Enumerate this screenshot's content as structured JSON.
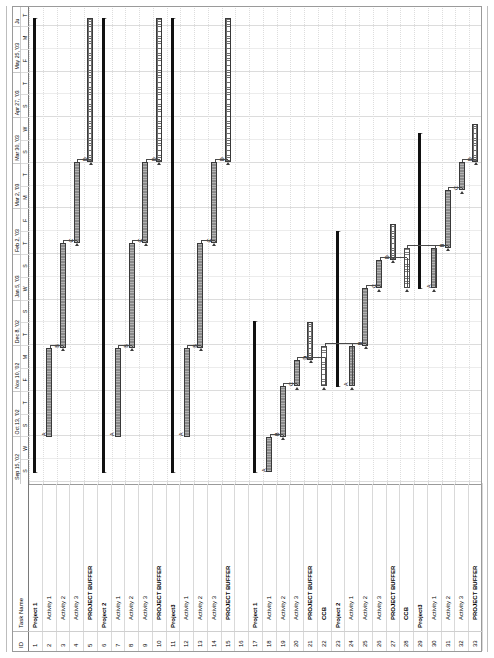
{
  "app": {
    "view_name": "Gantt Chart"
  },
  "table": {
    "headers": {
      "id": "ID",
      "name": "Task Name"
    },
    "rows": [
      {
        "id": "1",
        "name": "Project 1",
        "level": 0
      },
      {
        "id": "2",
        "name": "Activity 1",
        "level": 1
      },
      {
        "id": "3",
        "name": "Activity 2",
        "level": 1
      },
      {
        "id": "4",
        "name": "Activity 3",
        "level": 1
      },
      {
        "id": "5",
        "name": "PROJECT BUFFER",
        "level": 2
      },
      {
        "id": "6",
        "name": "Project 2",
        "level": 0
      },
      {
        "id": "7",
        "name": "Activity 1",
        "level": 1
      },
      {
        "id": "8",
        "name": "Activity 2",
        "level": 1
      },
      {
        "id": "9",
        "name": "Activity 3",
        "level": 1
      },
      {
        "id": "10",
        "name": "PROJECT BUFFER",
        "level": 2
      },
      {
        "id": "11",
        "name": "Project3",
        "level": 0
      },
      {
        "id": "12",
        "name": "Activity 1",
        "level": 1
      },
      {
        "id": "13",
        "name": "Activity 2",
        "level": 1
      },
      {
        "id": "14",
        "name": "Activity 3",
        "level": 1
      },
      {
        "id": "15",
        "name": "PROJECT BUFFER",
        "level": 2
      },
      {
        "id": "16",
        "name": "",
        "level": 1
      },
      {
        "id": "17",
        "name": "Project 1",
        "level": 0
      },
      {
        "id": "18",
        "name": "Activity 1",
        "level": 1
      },
      {
        "id": "19",
        "name": "Activity 2",
        "level": 1
      },
      {
        "id": "20",
        "name": "Activity 3",
        "level": 1
      },
      {
        "id": "21",
        "name": "PROJECT BUFFER",
        "level": 2
      },
      {
        "id": "22",
        "name": "CCB",
        "level": 2
      },
      {
        "id": "23",
        "name": "Project 2",
        "level": 0
      },
      {
        "id": "24",
        "name": "Activity 1",
        "level": 1
      },
      {
        "id": "25",
        "name": "Activity 2",
        "level": 1
      },
      {
        "id": "26",
        "name": "Activity 3",
        "level": 1
      },
      {
        "id": "27",
        "name": "PROJECT BUFFER",
        "level": 2
      },
      {
        "id": "28",
        "name": "CCB",
        "level": 2
      },
      {
        "id": "29",
        "name": "Project3",
        "level": 0
      },
      {
        "id": "30",
        "name": "Activity 1",
        "level": 1
      },
      {
        "id": "31",
        "name": "Activity 2",
        "level": 1
      },
      {
        "id": "32",
        "name": "Activity 3",
        "level": 1
      },
      {
        "id": "33",
        "name": "PROJECT BUFFER",
        "level": 2
      }
    ]
  },
  "timescale": {
    "major": [
      {
        "label": "Sep 15, '02"
      },
      {
        "label": "Oct 13, '02"
      },
      {
        "label": "Nov 10, '02"
      },
      {
        "label": "Dec 8, '02"
      },
      {
        "label": "Jan 5, '03"
      },
      {
        "label": "Feb 2, '03"
      },
      {
        "label": "Mar 2, '03"
      },
      {
        "label": "Mar 30, '03"
      },
      {
        "label": "Apr 27, '03"
      },
      {
        "label": "May 25, '03"
      },
      {
        "label": "Ju"
      }
    ],
    "minor": [
      "S",
      "W",
      "S",
      "T",
      "F",
      "M",
      "T",
      "S",
      "W",
      "S",
      "T",
      "F",
      "M",
      "T",
      "S",
      "W",
      "S",
      "T",
      "F",
      "M",
      "T",
      "S"
    ],
    "minor_sequence": [
      "S",
      "W",
      "S",
      "T",
      "F",
      "M",
      "T",
      "S",
      "W",
      "S",
      "T",
      "F",
      "M",
      "T",
      "S",
      "W",
      "S",
      "T",
      "F",
      "M",
      "T",
      "S"
    ]
  },
  "chart_data": {
    "type": "bar",
    "xlabel": "",
    "ylabel": "",
    "date_start": "Sep 15, '02",
    "date_end": "Jun '03",
    "bar_kinds": {
      "summary": "project summary rollup",
      "task": "critical chain activity",
      "fbuf": "feeding buffer",
      "pbuf": "project buffer"
    },
    "bars": [
      {
        "row": 1,
        "kind": "summary",
        "start": 2.0,
        "end": 97.0,
        "label": ""
      },
      {
        "row": 2,
        "kind": "task",
        "start": 9.5,
        "end": 28.0,
        "label": "A"
      },
      {
        "row": 3,
        "kind": "task",
        "start": 28.0,
        "end": 50.0,
        "label": "B"
      },
      {
        "row": 4,
        "kind": "task",
        "start": 50.0,
        "end": 67.0,
        "label": "C"
      },
      {
        "row": 5,
        "kind": "pbuf",
        "start": 67.0,
        "end": 97.0,
        "label": "D"
      },
      {
        "row": 6,
        "kind": "summary",
        "start": 2.0,
        "end": 97.0,
        "label": ""
      },
      {
        "row": 7,
        "kind": "task",
        "start": 9.5,
        "end": 28.0,
        "label": "A"
      },
      {
        "row": 8,
        "kind": "task",
        "start": 28.0,
        "end": 50.0,
        "label": "B"
      },
      {
        "row": 9,
        "kind": "task",
        "start": 50.0,
        "end": 67.0,
        "label": "C"
      },
      {
        "row": 10,
        "kind": "pbuf",
        "start": 67.0,
        "end": 97.0,
        "label": "D"
      },
      {
        "row": 11,
        "kind": "summary",
        "start": 2.0,
        "end": 97.0,
        "label": ""
      },
      {
        "row": 12,
        "kind": "task",
        "start": 9.5,
        "end": 28.0,
        "label": "A"
      },
      {
        "row": 13,
        "kind": "task",
        "start": 28.0,
        "end": 50.0,
        "label": "B"
      },
      {
        "row": 14,
        "kind": "task",
        "start": 50.0,
        "end": 67.0,
        "label": "C"
      },
      {
        "row": 15,
        "kind": "pbuf",
        "start": 67.0,
        "end": 97.0,
        "label": "D"
      },
      {
        "row": 17,
        "kind": "summary",
        "start": 2.0,
        "end": 33.5,
        "label": ""
      },
      {
        "row": 18,
        "kind": "task",
        "start": 2.0,
        "end": 9.5,
        "label": "A"
      },
      {
        "row": 19,
        "kind": "task",
        "start": 9.5,
        "end": 20.0,
        "label": "B"
      },
      {
        "row": 20,
        "kind": "task",
        "start": 20.0,
        "end": 25.5,
        "label": "C"
      },
      {
        "row": 21,
        "kind": "pbuf",
        "start": 25.5,
        "end": 33.5,
        "label": "D"
      },
      {
        "row": 22,
        "kind": "fbuf",
        "start": 20.0,
        "end": 28.5,
        "label": ""
      },
      {
        "row": 23,
        "kind": "summary",
        "start": 20.0,
        "end": 52.5,
        "label": ""
      },
      {
        "row": 24,
        "kind": "task",
        "start": 20.0,
        "end": 28.5,
        "label": "A"
      },
      {
        "row": 25,
        "kind": "task",
        "start": 28.5,
        "end": 40.5,
        "label": "B"
      },
      {
        "row": 26,
        "kind": "task",
        "start": 40.5,
        "end": 46.5,
        "label": "C"
      },
      {
        "row": 27,
        "kind": "pbuf",
        "start": 46.5,
        "end": 54.0,
        "label": "D"
      },
      {
        "row": 28,
        "kind": "fbuf",
        "start": 40.5,
        "end": 49.0,
        "label": ""
      },
      {
        "row": 29,
        "kind": "summary",
        "start": 40.5,
        "end": 73.0,
        "label": ""
      },
      {
        "row": 30,
        "kind": "task",
        "start": 40.5,
        "end": 49.0,
        "label": "A"
      },
      {
        "row": 31,
        "kind": "task",
        "start": 49.0,
        "end": 61.0,
        "label": "B"
      },
      {
        "row": 32,
        "kind": "task",
        "start": 61.0,
        "end": 67.0,
        "label": "C"
      },
      {
        "row": 33,
        "kind": "pbuf",
        "start": 67.0,
        "end": 75.0,
        "label": "D"
      }
    ],
    "links": [
      {
        "from": 2,
        "to": 3
      },
      {
        "from": 3,
        "to": 4
      },
      {
        "from": 4,
        "to": 5
      },
      {
        "from": 7,
        "to": 8
      },
      {
        "from": 8,
        "to": 9
      },
      {
        "from": 9,
        "to": 10
      },
      {
        "from": 12,
        "to": 13
      },
      {
        "from": 13,
        "to": 14
      },
      {
        "from": 14,
        "to": 15
      },
      {
        "from": 18,
        "to": 19
      },
      {
        "from": 19,
        "to": 20
      },
      {
        "from": 20,
        "to": 21
      },
      {
        "from": 20,
        "to": 22
      },
      {
        "from": 22,
        "to": 24
      },
      {
        "from": 24,
        "to": 25
      },
      {
        "from": 25,
        "to": 26
      },
      {
        "from": 26,
        "to": 27
      },
      {
        "from": 26,
        "to": 28
      },
      {
        "from": 28,
        "to": 30
      },
      {
        "from": 30,
        "to": 31
      },
      {
        "from": 31,
        "to": 32
      },
      {
        "from": 32,
        "to": 33
      }
    ]
  }
}
